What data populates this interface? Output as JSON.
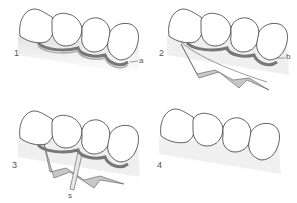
{
  "figure": {
    "colors": {
      "outline": "#3a3a3a",
      "tooth_fill": "#ffffff",
      "shadow": "#d9d9d9",
      "band": "#9a9a9a",
      "flap_fill": "#c8c8c8"
    },
    "panels": [
      {
        "number": "1",
        "label": "a"
      },
      {
        "number": "2",
        "label": "b"
      },
      {
        "number": "3",
        "label": "s"
      },
      {
        "number": "4",
        "label": ""
      }
    ]
  }
}
